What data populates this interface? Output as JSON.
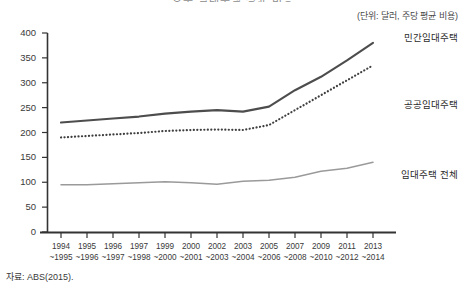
{
  "title_clipped": "호주 임대주택 평균 비용",
  "unit_label": "(단위: 달러, 주당 평균 비용)",
  "source_note": "자료: ABS(2015).",
  "legend": {
    "private": "민간임대주택",
    "public": "공공임대주택",
    "total": "임대주택 전체"
  },
  "colors": {
    "private": "#4d4d4d",
    "public": "#3f3f3f",
    "total": "#9a9a9a",
    "axis": "#333333",
    "text": "#3a3a3a"
  },
  "chart_data": {
    "type": "line",
    "title": "호주 임대주택 평균 비용",
    "xlabel": "",
    "ylabel": "(단위: 달러, 주당 평균 비용)",
    "ylim": [
      0,
      400
    ],
    "yticks": [
      0,
      50,
      100,
      150,
      200,
      250,
      300,
      350,
      400
    ],
    "grid": false,
    "legend_position": "right-inline",
    "categories": [
      "1994\n~1995",
      "1995\n~1996",
      "1996\n~1997",
      "1997\n~1998",
      "1999\n~2000",
      "2000\n~2001",
      "2002\n~2003",
      "2003\n~2004",
      "2005\n~2006",
      "2007\n~2008",
      "2009\n~2010",
      "2011\n~2012",
      "2013\n~2014"
    ],
    "categories_line1": [
      "1994",
      "1995",
      "1996",
      "1997",
      "1999",
      "2000",
      "2002",
      "2003",
      "2005",
      "2007",
      "2009",
      "2011",
      "2013"
    ],
    "categories_line2": [
      "~1995",
      "~1996",
      "~1997",
      "~1998",
      "~2000",
      "~2001",
      "~2003",
      "~2004",
      "~2006",
      "~2008",
      "~2010",
      "~2012",
      "~2014"
    ],
    "series": [
      {
        "name": "민간임대주택",
        "style": "solid",
        "color": "#4d4d4d",
        "values": [
          220,
          224,
          228,
          232,
          238,
          242,
          245,
          242,
          252,
          285,
          312,
          345,
          380
        ]
      },
      {
        "name": "공공임대주택",
        "style": "dotted",
        "color": "#3f3f3f",
        "values": [
          190,
          193,
          196,
          199,
          203,
          205,
          206,
          205,
          215,
          245,
          275,
          305,
          335
        ]
      },
      {
        "name": "임대주택 전체",
        "style": "solid-light",
        "color": "#9a9a9a",
        "values": [
          95,
          95,
          97,
          99,
          101,
          99,
          96,
          102,
          104,
          110,
          122,
          128,
          140
        ]
      }
    ]
  }
}
